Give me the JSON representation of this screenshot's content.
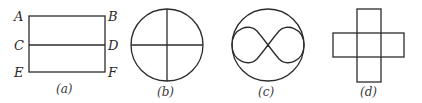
{
  "figures": {
    "a": {
      "caption": "(a)",
      "labels": {
        "A": "A",
        "B": "B",
        "C": "C",
        "D": "D",
        "E": "E",
        "F": "F"
      },
      "shape": "rectangle with horizontal midline"
    },
    "b": {
      "caption": "(b)",
      "shape": "circle with vertical and horizontal diameters"
    },
    "c": {
      "caption": "(c)",
      "shape": "circle with inscribed figure-eight (lemniscate)"
    },
    "d": {
      "caption": "(d)",
      "shape": "plus-shaped cross of five squares"
    }
  },
  "colors": {
    "stroke": "#2b2b2b",
    "background": "#ffffff"
  }
}
